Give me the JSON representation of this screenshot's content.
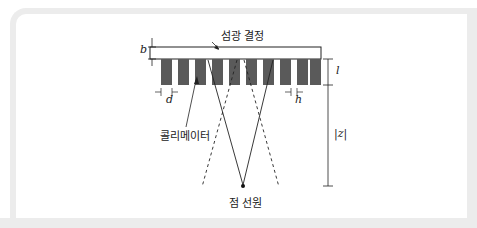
{
  "diagram": {
    "labels": {
      "crystal": "섬광 결정",
      "collimator": "콜리메이터",
      "point_source": "점 선원",
      "b": "b",
      "d": "d",
      "h": "h",
      "l": "l",
      "z": "|z|"
    },
    "colors": {
      "bar_fill": "#5a5a5a",
      "line": "#222222",
      "frame": "#ececec"
    },
    "collimator": {
      "bar_count": 10
    }
  }
}
